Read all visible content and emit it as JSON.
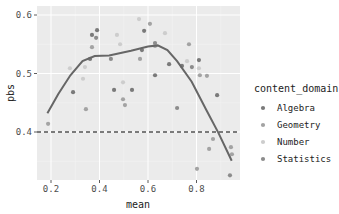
{
  "chart_data": {
    "type": "scatter",
    "title": "",
    "xlabel": "mean",
    "ylabel": "pbs",
    "xlim": [
      0.16,
      0.97
    ],
    "ylim": [
      0.315,
      0.61
    ],
    "x_ticks": [
      0.2,
      0.4,
      0.6,
      0.8
    ],
    "x_tick_labels": [
      "0.2",
      "0.4",
      "0.6",
      "0.8"
    ],
    "y_ticks": [
      0.4,
      0.5,
      0.6
    ],
    "y_tick_labels": [
      "0.4",
      "0.5",
      "0.6"
    ],
    "grid": true,
    "reference_line": {
      "type": "hline",
      "y": 0.4,
      "style": "dashed",
      "color": "#000000"
    },
    "legend": {
      "title": "content_domain",
      "placement": "right",
      "entries": [
        {
          "name": "Algebra",
          "color": "#7a7a7a"
        },
        {
          "name": "Geometry",
          "color": "#a3a3a3"
        },
        {
          "name": "Number",
          "color": "#cdcdcd"
        },
        {
          "name": "Statistics",
          "color": "#8c8c8c"
        }
      ]
    },
    "points": [
      {
        "x": 0.39,
        "y": 0.574,
        "group": "Algebra"
      },
      {
        "x": 0.369,
        "y": 0.566,
        "group": "Algebra"
      },
      {
        "x": 0.386,
        "y": 0.561,
        "group": "Statistics"
      },
      {
        "x": 0.369,
        "y": 0.545,
        "group": "Geometry"
      },
      {
        "x": 0.361,
        "y": 0.525,
        "group": "Algebra"
      },
      {
        "x": 0.34,
        "y": 0.511,
        "group": "Number"
      },
      {
        "x": 0.278,
        "y": 0.509,
        "group": "Number"
      },
      {
        "x": 0.332,
        "y": 0.491,
        "group": "Number"
      },
      {
        "x": 0.291,
        "y": 0.468,
        "group": "Algebra"
      },
      {
        "x": 0.344,
        "y": 0.439,
        "group": "Geometry"
      },
      {
        "x": 0.188,
        "y": 0.414,
        "group": "Geometry"
      },
      {
        "x": 0.46,
        "y": 0.472,
        "group": "Algebra"
      },
      {
        "x": 0.563,
        "y": 0.593,
        "group": "Number"
      },
      {
        "x": 0.608,
        "y": 0.585,
        "group": "Geometry"
      },
      {
        "x": 0.584,
        "y": 0.573,
        "group": "Algebra"
      },
      {
        "x": 0.67,
        "y": 0.569,
        "group": "Number"
      },
      {
        "x": 0.472,
        "y": 0.566,
        "group": "Number"
      },
      {
        "x": 0.485,
        "y": 0.55,
        "group": "Number"
      },
      {
        "x": 0.629,
        "y": 0.552,
        "group": "Statistics"
      },
      {
        "x": 0.629,
        "y": 0.547,
        "group": "Geometry"
      },
      {
        "x": 0.575,
        "y": 0.54,
        "group": "Algebra"
      },
      {
        "x": 0.567,
        "y": 0.525,
        "group": "Geometry"
      },
      {
        "x": 0.447,
        "y": 0.525,
        "group": "Statistics"
      },
      {
        "x": 0.687,
        "y": 0.516,
        "group": "Algebra"
      },
      {
        "x": 0.629,
        "y": 0.497,
        "group": "Algebra"
      },
      {
        "x": 0.497,
        "y": 0.485,
        "group": "Number"
      },
      {
        "x": 0.534,
        "y": 0.472,
        "group": "Algebra"
      },
      {
        "x": 0.497,
        "y": 0.456,
        "group": "Geometry"
      },
      {
        "x": 0.505,
        "y": 0.446,
        "group": "Geometry"
      },
      {
        "x": 0.72,
        "y": 0.441,
        "group": "Statistics"
      },
      {
        "x": 0.769,
        "y": 0.55,
        "group": "Geometry"
      },
      {
        "x": 0.81,
        "y": 0.523,
        "group": "Algebra"
      },
      {
        "x": 0.761,
        "y": 0.521,
        "group": "Number"
      },
      {
        "x": 0.781,
        "y": 0.511,
        "group": "Statistics"
      },
      {
        "x": 0.81,
        "y": 0.509,
        "group": "Number"
      },
      {
        "x": 0.74,
        "y": 0.513,
        "group": "Algebra"
      },
      {
        "x": 0.814,
        "y": 0.497,
        "group": "Geometry"
      },
      {
        "x": 0.843,
        "y": 0.496,
        "group": "Geometry"
      },
      {
        "x": 0.885,
        "y": 0.463,
        "group": "Algebra"
      },
      {
        "x": 0.868,
        "y": 0.388,
        "group": "Geometry"
      },
      {
        "x": 0.852,
        "y": 0.371,
        "group": "Geometry"
      },
      {
        "x": 0.942,
        "y": 0.374,
        "group": "Geometry"
      },
      {
        "x": 0.946,
        "y": 0.362,
        "group": "Geometry"
      },
      {
        "x": 0.802,
        "y": 0.337,
        "group": "Geometry"
      },
      {
        "x": 0.938,
        "y": 0.326,
        "group": "Statistics"
      }
    ],
    "smooth_line": {
      "color": "#666666",
      "x": [
        0.185,
        0.23,
        0.28,
        0.33,
        0.38,
        0.44,
        0.53,
        0.6,
        0.64,
        0.68,
        0.72,
        0.78,
        0.84,
        0.89,
        0.945
      ],
      "y": [
        0.432,
        0.465,
        0.497,
        0.521,
        0.53,
        0.531,
        0.539,
        0.546,
        0.548,
        0.54,
        0.521,
        0.486,
        0.438,
        0.399,
        0.351
      ]
    }
  }
}
